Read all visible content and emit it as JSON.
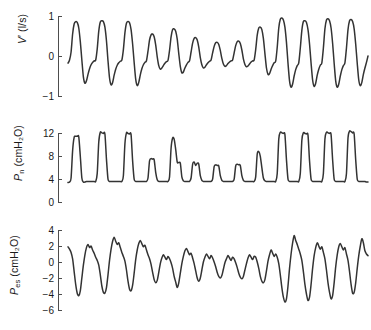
{
  "figure": {
    "background": "#ffffff",
    "trace_color": "#333333",
    "axis_color": "#4d4d4d",
    "text_color": "#1a1a1a"
  },
  "chart_data": [
    {
      "type": "line",
      "name": "airflow",
      "title": "",
      "xlabel": "",
      "ylabel": "V′ (l/s)",
      "ylabel_symbol": "V",
      "ylabel_prime": "′",
      "ylabel_units": "(l/s)",
      "yticks": [
        1,
        0,
        -1
      ],
      "yticklabels": [
        "1",
        "0",
        "-1"
      ],
      "ylim": [
        -1,
        1
      ],
      "xlim": [
        0,
        100
      ],
      "grid": false,
      "legend": false,
      "values": [
        -0.18,
        -0.1,
        0.1,
        0.55,
        0.8,
        0.86,
        0.84,
        0.7,
        0.36,
        -0.1,
        -0.52,
        -0.68,
        -0.62,
        -0.46,
        -0.32,
        -0.22,
        -0.16,
        -0.12,
        -0.1,
        0.18,
        0.62,
        0.85,
        0.88,
        0.86,
        0.72,
        0.38,
        -0.12,
        -0.55,
        -0.72,
        -0.66,
        -0.48,
        -0.33,
        -0.23,
        -0.17,
        -0.13,
        -0.1,
        0.16,
        0.58,
        0.82,
        0.86,
        0.83,
        0.66,
        0.3,
        -0.16,
        -0.58,
        -0.74,
        -0.66,
        -0.47,
        -0.32,
        -0.22,
        -0.16,
        -0.12,
        0.12,
        0.4,
        0.53,
        0.55,
        0.48,
        0.28,
        -0.02,
        -0.24,
        -0.33,
        -0.3,
        -0.24,
        -0.18,
        -0.14,
        -0.11,
        0.14,
        0.48,
        0.66,
        0.68,
        0.62,
        0.42,
        0.06,
        -0.26,
        -0.42,
        -0.4,
        -0.3,
        -0.22,
        -0.16,
        -0.12,
        0.1,
        0.32,
        0.44,
        0.46,
        0.4,
        0.22,
        -0.04,
        -0.22,
        -0.3,
        -0.28,
        -0.22,
        -0.17,
        -0.13,
        -0.1,
        0.08,
        0.24,
        0.33,
        0.34,
        0.29,
        0.14,
        -0.06,
        -0.2,
        -0.26,
        -0.24,
        -0.19,
        -0.15,
        -0.12,
        -0.1,
        0.08,
        0.26,
        0.36,
        0.37,
        0.31,
        0.15,
        -0.07,
        -0.21,
        -0.27,
        -0.25,
        -0.2,
        -0.15,
        -0.12,
        -0.1,
        0.16,
        0.52,
        0.7,
        0.72,
        0.66,
        0.44,
        0.06,
        -0.3,
        -0.46,
        -0.44,
        -0.33,
        -0.24,
        -0.17,
        -0.13,
        0.22,
        0.7,
        0.92,
        0.95,
        0.9,
        0.72,
        0.34,
        -0.18,
        -0.62,
        -0.78,
        -0.7,
        -0.5,
        -0.34,
        -0.24,
        -0.17,
        0.2,
        0.64,
        0.86,
        0.88,
        0.84,
        0.66,
        0.3,
        -0.18,
        -0.6,
        -0.76,
        -0.68,
        -0.48,
        -0.33,
        -0.23,
        -0.17,
        0.2,
        0.68,
        0.9,
        0.93,
        0.88,
        0.7,
        0.32,
        -0.18,
        -0.62,
        -0.78,
        -0.7,
        -0.5,
        -0.34,
        -0.24,
        -0.17,
        0.2,
        0.66,
        0.88,
        0.91,
        0.86,
        0.68,
        0.3,
        -0.18,
        -0.6,
        -0.74,
        -0.66,
        -0.46,
        -0.3,
        -0.16,
        0.0
      ]
    },
    {
      "type": "line",
      "name": "mask-pressure",
      "title": "",
      "xlabel": "",
      "ylabel": "Pn (cmH2O)",
      "ylabel_symbol": "P",
      "ylabel_subscript": "n",
      "ylabel_units": "(cmH₂O)",
      "yticks": [
        12,
        8,
        4,
        0
      ],
      "yticklabels": [
        "12",
        "8",
        "4",
        "0"
      ],
      "ylim": [
        0,
        14
      ],
      "xlim": [
        0,
        100
      ],
      "grid": false,
      "legend": false,
      "values": [
        3.4,
        3.5,
        4.2,
        9.0,
        11.3,
        11.5,
        11.5,
        11.4,
        8.0,
        4.2,
        3.5,
        3.5,
        3.6,
        3.6,
        3.6,
        3.6,
        3.6,
        3.6,
        3.6,
        5.0,
        10.5,
        12.2,
        12.1,
        12.0,
        11.9,
        7.5,
        4.0,
        3.6,
        3.6,
        3.6,
        3.6,
        3.6,
        3.6,
        3.6,
        3.6,
        3.6,
        4.6,
        10.2,
        12.1,
        12.0,
        11.9,
        11.8,
        7.2,
        4.0,
        3.6,
        3.6,
        3.6,
        3.6,
        3.6,
        3.6,
        3.6,
        3.6,
        4.2,
        7.2,
        7.6,
        7.5,
        7.4,
        5.2,
        3.9,
        3.6,
        3.6,
        3.6,
        3.6,
        3.6,
        3.6,
        3.6,
        4.4,
        9.4,
        11.2,
        11.0,
        9.2,
        7.0,
        6.9,
        6.8,
        4.4,
        3.7,
        3.6,
        3.6,
        3.6,
        3.6,
        4.2,
        6.6,
        7.0,
        6.4,
        6.8,
        6.6,
        4.6,
        3.8,
        3.6,
        3.6,
        3.6,
        3.6,
        3.6,
        3.6,
        4.0,
        6.2,
        6.5,
        6.4,
        6.3,
        4.6,
        3.8,
        3.6,
        3.6,
        3.6,
        3.6,
        3.6,
        3.6,
        3.6,
        4.0,
        6.3,
        6.6,
        6.5,
        6.4,
        4.6,
        3.8,
        3.6,
        3.6,
        3.6,
        3.6,
        3.6,
        3.6,
        3.6,
        4.4,
        8.4,
        8.8,
        8.0,
        6.0,
        4.2,
        3.7,
        3.6,
        3.6,
        3.6,
        3.6,
        3.6,
        3.6,
        3.6,
        5.0,
        11.0,
        12.2,
        12.1,
        12.0,
        11.8,
        7.4,
        4.0,
        3.6,
        3.6,
        3.6,
        3.6,
        3.6,
        3.6,
        3.6,
        5.0,
        10.8,
        12.1,
        12.0,
        11.9,
        11.7,
        7.2,
        4.0,
        3.6,
        3.6,
        3.6,
        3.6,
        3.6,
        3.6,
        3.6,
        5.0,
        11.0,
        12.2,
        12.1,
        12.0,
        11.8,
        7.4,
        4.0,
        3.6,
        3.6,
        3.6,
        3.6,
        3.6,
        3.6,
        3.6,
        5.0,
        11.2,
        12.4,
        12.3,
        12.1,
        11.9,
        7.4,
        4.0,
        3.6,
        3.6,
        3.6,
        3.6,
        3.6,
        3.5,
        3.5
      ]
    },
    {
      "type": "line",
      "name": "esophageal-pressure",
      "title": "",
      "xlabel": "",
      "ylabel": "Pes (cmH2O)",
      "ylabel_symbol": "P",
      "ylabel_subscript": "es",
      "ylabel_units": "(cmH₂O)",
      "yticks": [
        4,
        2,
        0,
        -2,
        -4,
        -6
      ],
      "yticklabels": [
        "4",
        "2",
        "0",
        "-2",
        "-4",
        "-6"
      ],
      "ylim": [
        -6,
        4
      ],
      "xlim": [
        0,
        100
      ],
      "grid": false,
      "legend": false,
      "values": [
        1.9,
        1.6,
        1.2,
        0.4,
        -1.2,
        -2.8,
        -3.9,
        -4.2,
        -3.6,
        -2.0,
        -0.4,
        0.9,
        1.8,
        2.2,
        1.8,
        2.0,
        1.5,
        1.1,
        0.6,
        0.2,
        -0.4,
        -1.6,
        -3.0,
        -3.8,
        -3.9,
        -3.2,
        -1.6,
        0.2,
        1.6,
        2.6,
        3.1,
        2.6,
        2.2,
        2.4,
        1.8,
        1.2,
        0.7,
        0.1,
        -1.0,
        -2.4,
        -3.4,
        -3.6,
        -2.9,
        -1.4,
        0.3,
        1.5,
        2.3,
        2.7,
        2.3,
        1.9,
        2.1,
        1.5,
        0.9,
        0.4,
        -0.3,
        -1.3,
        -2.2,
        -2.6,
        -2.3,
        -1.3,
        -0.2,
        0.5,
        0.9,
        0.6,
        0.3,
        0.7,
        0.4,
        -0.1,
        -0.8,
        -1.8,
        -2.5,
        -3.2,
        -2.6,
        -1.4,
        -0.2,
        0.7,
        1.4,
        1.7,
        1.3,
        0.9,
        1.1,
        0.5,
        -0.2,
        -1.1,
        -2.0,
        -2.4,
        -2.0,
        -1.0,
        0.0,
        0.6,
        1.0,
        0.7,
        0.4,
        0.8,
        0.5,
        0.0,
        -0.6,
        -1.3,
        -1.8,
        -2.0,
        -1.7,
        -0.9,
        -0.1,
        0.4,
        0.8,
        0.5,
        0.2,
        0.6,
        0.4,
        -0.1,
        -0.7,
        -1.4,
        -1.9,
        -2.1,
        -1.8,
        -1.0,
        -0.2,
        0.5,
        0.9,
        0.6,
        0.3,
        0.7,
        0.6,
        0.0,
        -0.8,
        -1.8,
        -2.4,
        -2.6,
        -2.2,
        -1.1,
        0.1,
        0.9,
        1.5,
        1.1,
        0.7,
        1.0,
        0.6,
        -0.2,
        -1.6,
        -3.2,
        -4.4,
        -5.0,
        -4.6,
        -3.0,
        -0.8,
        1.0,
        2.4,
        3.3,
        2.7,
        2.2,
        1.6,
        1.0,
        0.2,
        -1.2,
        -2.8,
        -4.0,
        -4.8,
        -4.4,
        -2.8,
        -0.8,
        0.8,
        1.8,
        2.4,
        2.0,
        1.6,
        1.9,
        1.2,
        0.4,
        -1.0,
        -2.6,
        -3.8,
        -4.6,
        -4.2,
        -2.6,
        -0.6,
        0.9,
        1.9,
        2.3,
        1.9,
        1.5,
        1.8,
        1.0,
        0.2,
        -1.2,
        -2.8,
        -3.9,
        -3.8,
        -2.6,
        -0.8,
        0.8,
        2.0,
        2.9,
        2.4,
        1.4,
        1.0,
        0.8
      ]
    }
  ]
}
